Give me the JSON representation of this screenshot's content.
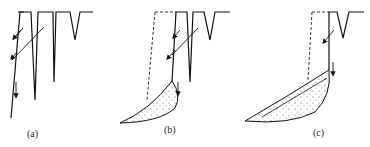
{
  "diagram": {
    "panels": [
      {
        "id": "a",
        "label": "(a)",
        "stage": "cracked slope face with block beginning to slide"
      },
      {
        "id": "b",
        "label": "(b)",
        "stage": "slab collapses, debris accumulates at toe"
      },
      {
        "id": "c",
        "label": "(c)",
        "stage": "further retreat, larger debris wedge"
      }
    ],
    "colors": {
      "line": "#111111",
      "dashed": "#333333",
      "background": "#ffffff"
    }
  }
}
